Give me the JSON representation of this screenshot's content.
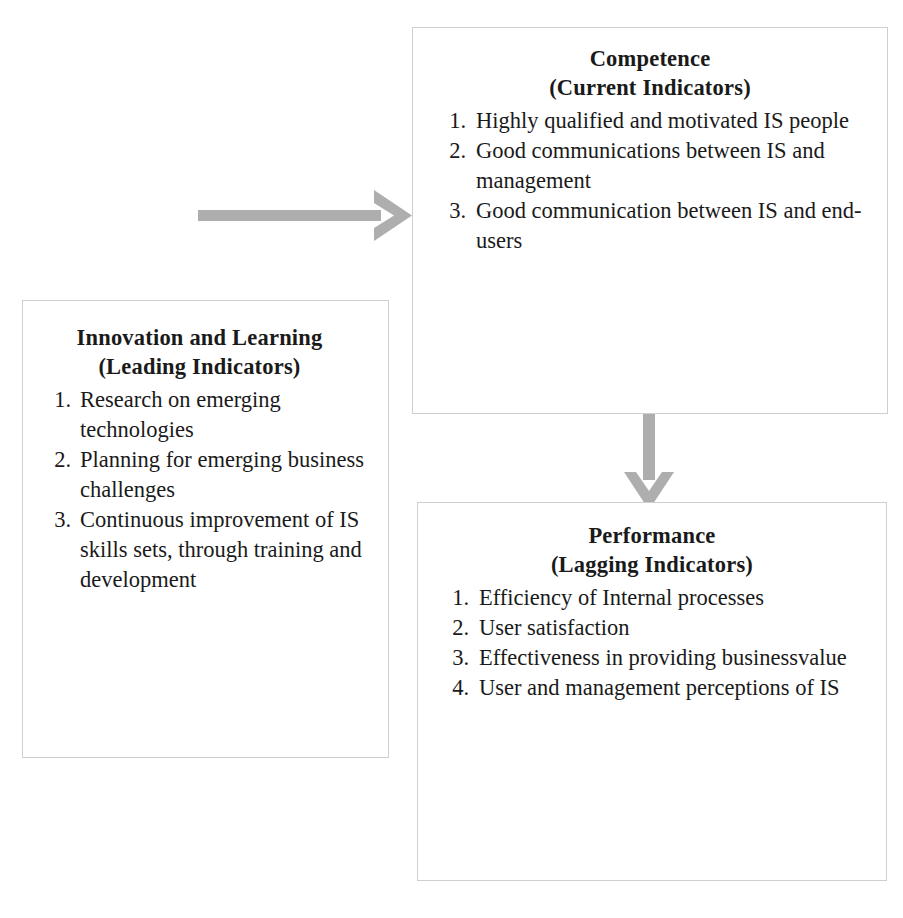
{
  "diagram": {
    "arrow_color": "#aeaeae",
    "box_border_color": "#cfcfcf",
    "text_color": "#1a1a1a"
  },
  "boxes": {
    "innovation": {
      "heading_line1": "Innovation and Learning",
      "heading_line2": "(Leading Indicators)",
      "items": [
        {
          "num": "1.",
          "text": "Research on emerging technologies"
        },
        {
          "num": "2.",
          "text": "Planning for emerging business challenges"
        },
        {
          "num": "3.",
          "text": "Continuous improvement of IS skills sets, through training and development"
        }
      ]
    },
    "competence": {
      "heading_line1": "Competence",
      "heading_line2": "(Current Indicators)",
      "items": [
        {
          "num": "1.",
          "text": "Highly qualified and motivated IS people"
        },
        {
          "num": "2.",
          "text": "Good communications between IS and management"
        },
        {
          "num": "3.",
          "text": "Good communication between IS and end-users"
        }
      ]
    },
    "performance": {
      "heading_line1": "Performance",
      "heading_line2": "(Lagging Indicators)",
      "items": [
        {
          "num": "1.",
          "text": "Efficiency of Internal processes"
        },
        {
          "num": "2.",
          "text": "User satisfaction"
        },
        {
          "num": "3.",
          "text": "Effectiveness in providing businessvalue"
        },
        {
          "num": "4.",
          "text": "User and management perceptions of IS"
        }
      ]
    }
  },
  "arrows": [
    {
      "name": "innovation-to-competence",
      "direction": "right"
    },
    {
      "name": "competence-to-performance",
      "direction": "down"
    }
  ]
}
